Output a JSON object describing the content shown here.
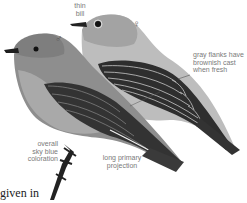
{
  "illustration": {
    "subject": "two bluebirds, male and female",
    "colors": {
      "male_body": "#8c8c8c",
      "male_breast": "#a8a8a8",
      "female_body": "#b9b9b9",
      "female_head": "#a5a5a5",
      "wing_dark": "#2e2e2e",
      "label_text": "#7a7a7a"
    }
  },
  "symbols": {
    "male": "♂",
    "female": "♀"
  },
  "labels": {
    "thin_bill_1": "thin",
    "thin_bill_2": "bill",
    "flanks_1": "gray flanks have",
    "flanks_2": "brownish cast",
    "flanks_3": "when fresh",
    "overall_1": "overall",
    "overall_2": "sky blue",
    "overall_3": "coloration",
    "primary_1": "long primary",
    "primary_2": "projection"
  },
  "caption": {
    "text": "given in",
    "partial_line": "...ll"
  }
}
